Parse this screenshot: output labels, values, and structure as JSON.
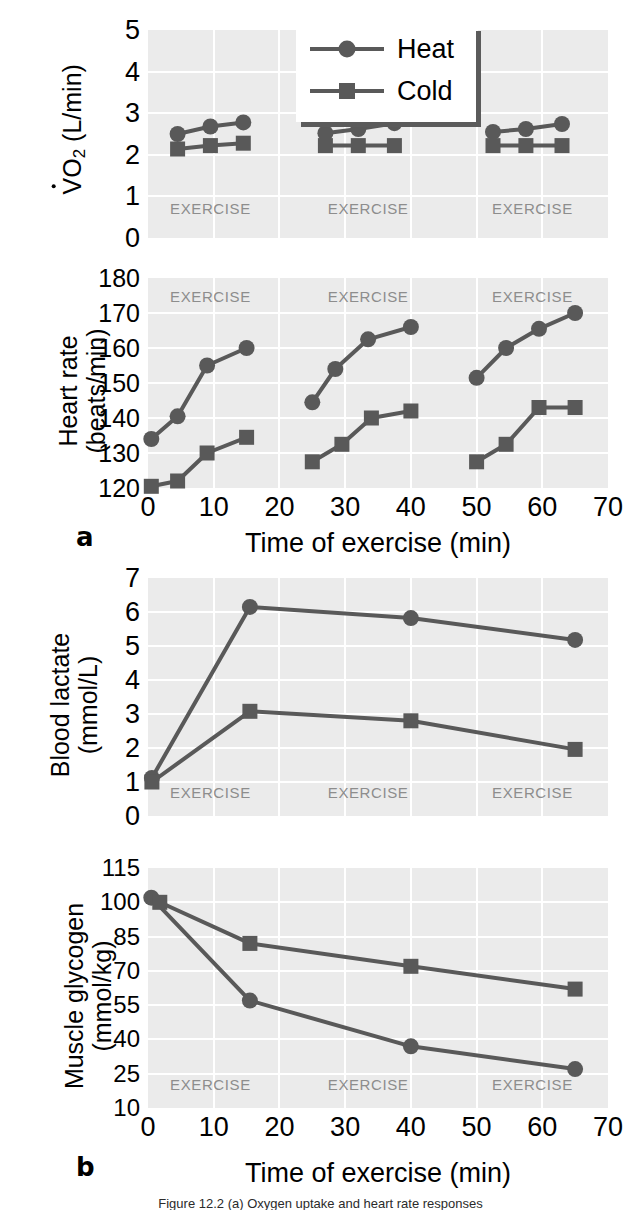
{
  "figure": {
    "panel_a_label": "a",
    "panel_b_label": "b",
    "xlabel": "Time of exercise (min)",
    "exercise_band_label": "EXERCISE",
    "marker_color": "#595959",
    "line_color": "#595959",
    "plot_bg_color": "#ebebeb",
    "grid_color": "#ffffff",
    "exercise_text_color": "#8d8d8d"
  },
  "legend": {
    "entries": [
      {
        "label": "Heat",
        "marker": "circle"
      },
      {
        "label": "Cold",
        "marker": "square"
      }
    ]
  },
  "chart_data": [
    {
      "id": "vo2",
      "type": "line",
      "title": "",
      "ylabel_line1": "VO2 (L/min)",
      "ylabel_plain": "VO₂ (L/min)",
      "xlabel": "",
      "xlim": [
        0,
        70
      ],
      "ylim": [
        0,
        5
      ],
      "yticks": [
        0,
        1,
        2,
        3,
        4,
        5
      ],
      "xticks": [],
      "grid": true,
      "exercise_bands": [
        [
          2,
          17
        ],
        [
          25,
          42
        ],
        [
          50,
          67
        ]
      ],
      "series": [
        {
          "name": "Heat",
          "marker": "circle",
          "points": [
            [
              4.5,
              2.5
            ],
            [
              9.5,
              2.68
            ],
            [
              14.5,
              2.78
            ],
            [
              27.0,
              2.52
            ],
            [
              32.0,
              2.62
            ],
            [
              37.5,
              2.76
            ],
            [
              52.5,
              2.55
            ],
            [
              57.5,
              2.62
            ],
            [
              63.0,
              2.74
            ]
          ],
          "segments": [
            [
              0,
              3
            ],
            [
              3,
              6
            ],
            [
              6,
              9
            ]
          ]
        },
        {
          "name": "Cold",
          "marker": "square",
          "points": [
            [
              4.5,
              2.14
            ],
            [
              9.5,
              2.22
            ],
            [
              14.5,
              2.28
            ],
            [
              27.0,
              2.22
            ],
            [
              32.0,
              2.22
            ],
            [
              37.5,
              2.22
            ],
            [
              52.5,
              2.22
            ],
            [
              57.5,
              2.22
            ],
            [
              63.0,
              2.22
            ]
          ],
          "segments": [
            [
              0,
              3
            ],
            [
              3,
              6
            ],
            [
              6,
              9
            ]
          ]
        }
      ]
    },
    {
      "id": "heart-rate",
      "type": "line",
      "title": "",
      "ylabel_line1": "Heart rate",
      "ylabel_line2": "(beats/min)",
      "xlabel": "Time of exercise (min)",
      "xlim": [
        0,
        70
      ],
      "ylim": [
        120,
        180
      ],
      "yticks": [
        120,
        130,
        140,
        150,
        160,
        170,
        180
      ],
      "xticks": [
        0,
        10,
        20,
        30,
        40,
        50,
        60,
        70
      ],
      "grid": true,
      "exercise_bands": [
        [
          2,
          17
        ],
        [
          25,
          42
        ],
        [
          50,
          67
        ]
      ],
      "series": [
        {
          "name": "Heat",
          "marker": "circle",
          "points": [
            [
              0.5,
              134
            ],
            [
              4.5,
              140.5
            ],
            [
              9.0,
              155
            ],
            [
              15.0,
              160
            ],
            [
              25.0,
              144.5
            ],
            [
              28.5,
              154
            ],
            [
              33.5,
              162.5
            ],
            [
              40.0,
              166
            ],
            [
              50.0,
              151.5
            ],
            [
              54.5,
              160
            ],
            [
              59.5,
              165.5
            ],
            [
              65.0,
              170
            ]
          ],
          "segments": [
            [
              0,
              4
            ],
            [
              4,
              8
            ],
            [
              8,
              12
            ]
          ]
        },
        {
          "name": "Cold",
          "marker": "square",
          "points": [
            [
              0.5,
              120.5
            ],
            [
              4.5,
              122
            ],
            [
              9.0,
              130
            ],
            [
              15.0,
              134.5
            ],
            [
              25.0,
              127.5
            ],
            [
              29.5,
              132.5
            ],
            [
              34.0,
              140
            ],
            [
              40.0,
              142
            ],
            [
              50.0,
              127.5
            ],
            [
              54.5,
              132.5
            ],
            [
              59.5,
              143
            ],
            [
              65.0,
              143
            ]
          ],
          "segments": [
            [
              0,
              4
            ],
            [
              4,
              8
            ],
            [
              8,
              12
            ]
          ]
        }
      ]
    },
    {
      "id": "blood-lactate",
      "type": "line",
      "title": "",
      "ylabel_line1": "Blood lactate",
      "ylabel_line2": "(mmol/L)",
      "xlabel": "",
      "xlim": [
        0,
        70
      ],
      "ylim": [
        0,
        7
      ],
      "yticks": [
        0,
        1,
        2,
        3,
        4,
        5,
        6,
        7
      ],
      "xticks": [],
      "grid": true,
      "exercise_bands": [
        [
          2,
          17
        ],
        [
          25,
          42
        ],
        [
          50,
          67
        ]
      ],
      "series": [
        {
          "name": "Heat",
          "marker": "circle",
          "points": [
            [
              0.6,
              1.12
            ],
            [
              15.5,
              6.15
            ],
            [
              40.0,
              5.82
            ],
            [
              65.0,
              5.18
            ]
          ],
          "segments": [
            [
              0,
              4
            ]
          ]
        },
        {
          "name": "Cold",
          "marker": "square",
          "points": [
            [
              0.6,
              1.0
            ],
            [
              15.5,
              3.08
            ],
            [
              40.0,
              2.8
            ],
            [
              65.0,
              1.96
            ]
          ],
          "segments": [
            [
              0,
              4
            ]
          ]
        }
      ]
    },
    {
      "id": "muscle-glycogen",
      "type": "line",
      "title": "",
      "ylabel_line1": "Muscle glycogen",
      "ylabel_line2": "(mmol/kg)",
      "xlabel": "Time of exercise (min)",
      "xlim": [
        0,
        70
      ],
      "ylim": [
        10,
        115
      ],
      "yticks": [
        10,
        25,
        40,
        55,
        70,
        85,
        100,
        115
      ],
      "xticks": [
        0,
        10,
        20,
        30,
        40,
        50,
        60,
        70
      ],
      "grid": true,
      "exercise_bands": [
        [
          2,
          17
        ],
        [
          25,
          42
        ],
        [
          50,
          67
        ]
      ],
      "series": [
        {
          "name": "Heat",
          "marker": "circle",
          "points": [
            [
              0.5,
              102
            ],
            [
              15.5,
              57
            ],
            [
              40.0,
              37
            ],
            [
              65.0,
              27
            ]
          ],
          "segments": [
            [
              0,
              4
            ]
          ]
        },
        {
          "name": "Cold",
          "marker": "square",
          "points": [
            [
              1.8,
              100
            ],
            [
              15.5,
              82
            ],
            [
              40.0,
              72
            ],
            [
              65.0,
              62
            ]
          ],
          "segments": [
            [
              0,
              4
            ]
          ]
        }
      ]
    }
  ],
  "caption": {
    "text": "Figure 12.2   (a) Oxygen uptake and heart rate responses"
  }
}
